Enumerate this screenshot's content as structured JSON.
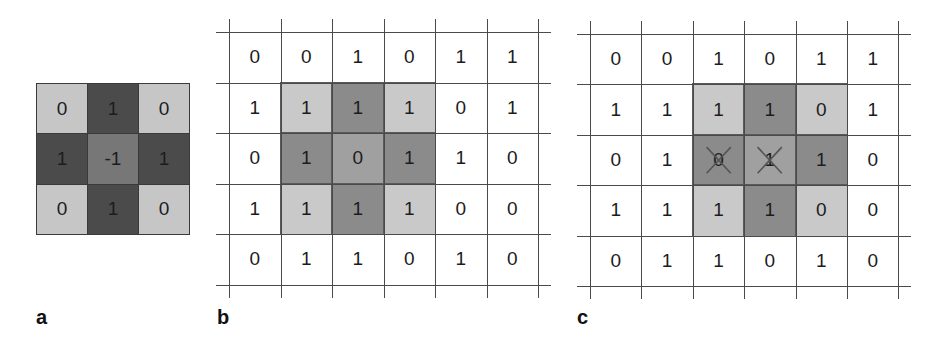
{
  "figure": {
    "colors": {
      "kernel_corner": "#c6c6c6",
      "kernel_edge": "#4b4b4b",
      "kernel_center": "#777777",
      "overlay_corner": "#c9c9c9",
      "overlay_edge": "#8b8b8b",
      "overlay_center": "#a0a0a0",
      "background": "#ffffff",
      "gridline": "#4a4a4a",
      "cross": "#555555"
    },
    "panels": {
      "a": {
        "label": "a",
        "title": "3x3 kernel",
        "values": [
          [
            "0",
            "1",
            "0"
          ],
          [
            "1",
            "-1",
            "1"
          ],
          [
            "0",
            "1",
            "0"
          ]
        ],
        "shades": [
          [
            "corner",
            "edge",
            "corner"
          ],
          [
            "edge",
            "center",
            "edge"
          ],
          [
            "corner",
            "edge",
            "corner"
          ]
        ]
      },
      "b": {
        "label": "b",
        "values": [
          [
            "0",
            "0",
            "1",
            "0",
            "1",
            "1"
          ],
          [
            "1",
            "1",
            "1",
            "1",
            "0",
            "1"
          ],
          [
            "0",
            "1",
            "0",
            "1",
            "1",
            "0"
          ],
          [
            "1",
            "1",
            "1",
            "1",
            "0",
            "0"
          ],
          [
            "0",
            "1",
            "1",
            "0",
            "1",
            "0"
          ]
        ],
        "overlay": {
          "row": 1,
          "col": 1,
          "size": 3
        },
        "crossed": []
      },
      "c": {
        "label": "c",
        "values": [
          [
            "0",
            "0",
            "1",
            "0",
            "1",
            "1"
          ],
          [
            "1",
            "1",
            "1",
            "1",
            "0",
            "1"
          ],
          [
            "0",
            "1",
            "0",
            "1",
            "1",
            "0"
          ],
          [
            "1",
            "1",
            "1",
            "1",
            "0",
            "0"
          ],
          [
            "0",
            "1",
            "1",
            "0",
            "1",
            "0"
          ]
        ],
        "overlay": {
          "row": 1,
          "col": 2,
          "size": 3
        },
        "crossed": [
          [
            2,
            2
          ],
          [
            2,
            3
          ]
        ]
      }
    }
  }
}
